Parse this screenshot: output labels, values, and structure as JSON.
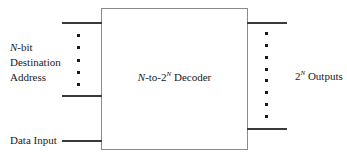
{
  "diagram": {
    "box": {
      "label_prefix": "N",
      "label_mid": "-to-2",
      "label_sup": "N",
      "label_suffix": " Decoder"
    },
    "left_label": {
      "line1_italic": "N",
      "line1_rest": "-bit",
      "line2": "Destination",
      "line3": "Address"
    },
    "data_input_label": "Data Input",
    "right_label": {
      "base": "2",
      "sup": "N",
      "rest": " Outputs"
    },
    "left_bus_dot_count": 5,
    "right_bus_dot_count": 8,
    "colors": {
      "box_stroke": "#8a8a8a",
      "wire": "#3a3a3a",
      "text": "#1a1a1a",
      "background": "#ffffff"
    }
  }
}
